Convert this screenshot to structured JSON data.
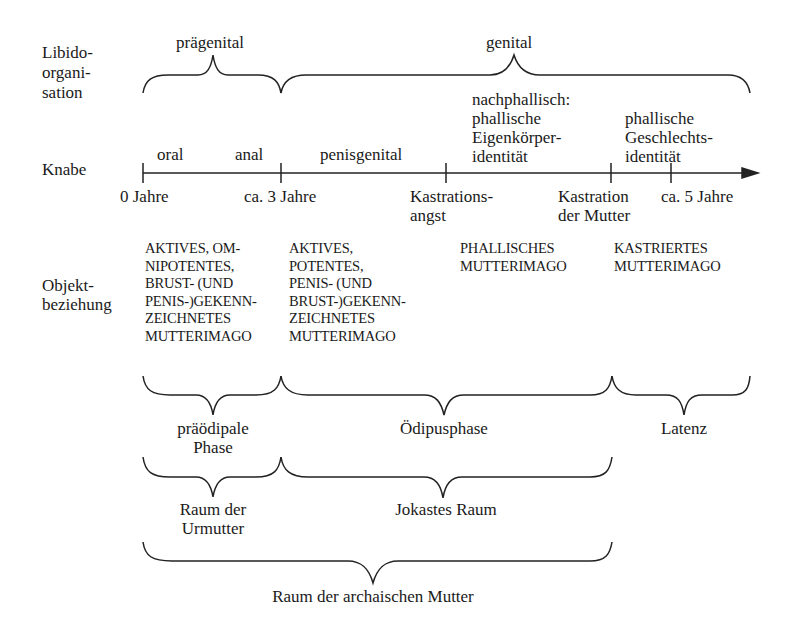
{
  "row_labels": {
    "libido": "Libido-\norgani-\nsation",
    "knabe": "Knabe",
    "objekt": "Objekt-\nbeziehung"
  },
  "libido_braces": {
    "pregenital": "prägenital",
    "genital": "genital"
  },
  "timeline": {
    "phases_above": {
      "oral": "oral",
      "anal": "anal",
      "penisgenital": "penisgenital",
      "nachphallisch": "nachphallisch:\nphallische\nEigenkörper-\nidentität",
      "phallische_geschlecht": "phallische\nGeschlechts-\nidentität"
    },
    "ticks_below": {
      "t0": "0 Jahre",
      "t3": "ca. 3 Jahre",
      "kastrationsangst": "Kastrations-\nangst",
      "kastration_mutter": "Kastration\nder Mutter",
      "t5": "ca. 5 Jahre"
    }
  },
  "object_relations": {
    "col1": "AKTIVES, OM-\nNIPOTENTES,\nBRUST- (UND\nPENIS-)GEKENN-\nZEICHNETES\nMUTTERIMAGO",
    "col2": "AKTIVES,\nPOTENTES,\nPENIS- (UND\nBRUST-)GEKENN-\nZEICHNETES\nMUTTERIMAGO",
    "col3": "PHALLISCHES\nMUTTERIMAGO",
    "col4": "KASTRIERTES\nMUTTERIMAGO"
  },
  "phase_braces": {
    "praeoedipal": "präödipale\nPhase",
    "oedipus": "Ödipusphase",
    "latenz": "Latenz"
  },
  "space_braces": {
    "urmutter": "Raum der\nUrmutter",
    "jokaste": "Jokastes Raum"
  },
  "archaic_brace": {
    "label": "Raum der archaischen Mutter"
  }
}
